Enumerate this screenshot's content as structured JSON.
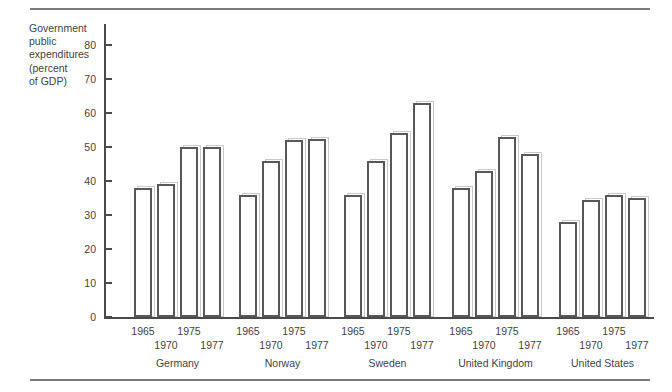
{
  "chart_data": {
    "type": "bar",
    "title": "",
    "ylabel_lines": [
      "Government",
      "public",
      "expenditures",
      "(percent",
      "of GDP)"
    ],
    "ylabel": "Government public expenditures (percent of GDP)",
    "xlabel": "",
    "ylim": [
      0,
      80
    ],
    "yticks": [
      0,
      10,
      20,
      30,
      40,
      50,
      60,
      70,
      80
    ],
    "grid": false,
    "legend": "none",
    "categories": [
      "Germany",
      "Norway",
      "Sweden",
      "United  Kingdom",
      "United States"
    ],
    "x": [
      "1965",
      "1970",
      "1975",
      "1977"
    ],
    "series": [
      {
        "name": "1965",
        "values": [
          38,
          36,
          36,
          38,
          28
        ]
      },
      {
        "name": "1970",
        "values": [
          39,
          46,
          46,
          43,
          34.5
        ]
      },
      {
        "name": "1975",
        "values": [
          50,
          52,
          54,
          53,
          36
        ]
      },
      {
        "name": "1977",
        "values": [
          50,
          52.5,
          63,
          48,
          35
        ]
      }
    ],
    "groups": [
      {
        "label": "Germany",
        "years": [
          "1965",
          "1970",
          "1975",
          "1977"
        ],
        "values": [
          38,
          39,
          50,
          50
        ]
      },
      {
        "label": "Norway",
        "years": [
          "1965",
          "1970",
          "1975",
          "1977"
        ],
        "values": [
          36,
          46,
          52,
          52.5
        ]
      },
      {
        "label": "Sweden",
        "years": [
          "1965",
          "1970",
          "1975",
          "1977"
        ],
        "values": [
          36,
          46,
          54,
          63
        ]
      },
      {
        "label": "United  Kingdom",
        "years": [
          "1965",
          "1970",
          "1975",
          "1977"
        ],
        "values": [
          38,
          43,
          53,
          48
        ]
      },
      {
        "label": "United States",
        "years": [
          "1965",
          "1970",
          "1975",
          "1977"
        ],
        "values": [
          28,
          34.5,
          36,
          35
        ]
      }
    ],
    "colors": {
      "bar_outline": "#585858",
      "bar_fill": "#ffffff",
      "bar_shadow": "#c9c9c9",
      "axis": "#4a4a4a",
      "rule": "#7a7a7a",
      "text": "#3f3f3f"
    }
  }
}
